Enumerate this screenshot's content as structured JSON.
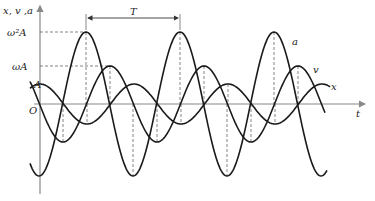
{
  "diagram": {
    "y_axis_label": "x, v ,a",
    "x_axis_label": "t",
    "origin_label": "O",
    "tick_labels": {
      "a_max": "ω²A",
      "v_max": "ωA",
      "x_max": "A"
    },
    "period_label": "T",
    "curve_labels": {
      "a": "a",
      "v": "v",
      "x": "x"
    },
    "colors": {
      "curve": "#1a1a1a",
      "axis": "#888888",
      "guide": "#666666"
    }
  }
}
